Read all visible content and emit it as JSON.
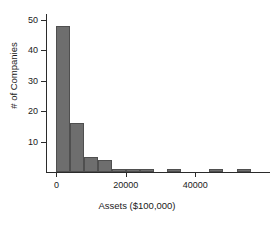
{
  "chart_data": {
    "type": "bar",
    "title": "",
    "subtitle": "",
    "xlabel": "Assets ($100,000)",
    "ylabel": "# of Companies",
    "xlim": [
      -3000,
      61000
    ],
    "ylim": [
      0,
      52
    ],
    "grid": false,
    "legend": null,
    "bin_width": 4000,
    "x_ticks": [
      {
        "value": 0,
        "label": "0"
      },
      {
        "value": 20000,
        "label": "20000"
      },
      {
        "value": 40000,
        "label": "40000"
      }
    ],
    "y_ticks": [
      {
        "value": 10,
        "label": "10"
      },
      {
        "value": 20,
        "label": "20"
      },
      {
        "value": 30,
        "label": "30"
      },
      {
        "value": 40,
        "label": "40"
      },
      {
        "value": 50,
        "label": "50"
      }
    ],
    "bars": [
      {
        "bin_start": 0,
        "bin_end": 4000,
        "value": 48
      },
      {
        "bin_start": 4000,
        "bin_end": 8000,
        "value": 16
      },
      {
        "bin_start": 8000,
        "bin_end": 12000,
        "value": 5
      },
      {
        "bin_start": 12000,
        "bin_end": 16000,
        "value": 4
      },
      {
        "bin_start": 16000,
        "bin_end": 20000,
        "value": 1
      },
      {
        "bin_start": 20000,
        "bin_end": 24000,
        "value": 1
      },
      {
        "bin_start": 24000,
        "bin_end": 28000,
        "value": 1
      },
      {
        "bin_start": 32000,
        "bin_end": 36000,
        "value": 1
      },
      {
        "bin_start": 44000,
        "bin_end": 48000,
        "value": 1
      },
      {
        "bin_start": 52000,
        "bin_end": 56000,
        "value": 1
      }
    ],
    "categories": [
      "0-4000",
      "4000-8000",
      "8000-12000",
      "12000-16000",
      "16000-20000",
      "20000-24000",
      "24000-28000",
      "32000-36000",
      "44000-48000",
      "52000-56000"
    ],
    "values": [
      48,
      16,
      5,
      4,
      1,
      1,
      1,
      1,
      1,
      1
    ],
    "colors": {
      "bar_fill": "#6e6e6e",
      "bar_edge": "#4f4f4f",
      "axis": "#2b2b2b",
      "text": "#1a1a1a",
      "background": "#ffffff"
    }
  }
}
